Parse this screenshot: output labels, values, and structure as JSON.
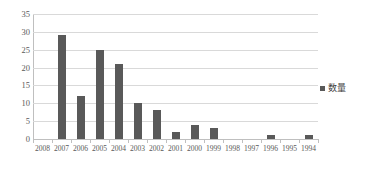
{
  "chart_data": {
    "type": "bar",
    "title": "",
    "xlabel": "",
    "ylabel": "",
    "categories": [
      "2008",
      "2007",
      "2006",
      "2005",
      "2004",
      "2003",
      "2002",
      "2001",
      "2000",
      "1999",
      "1998",
      "1997",
      "1996",
      "1995",
      "1994"
    ],
    "values": [
      0,
      29,
      12,
      25,
      21,
      10,
      8,
      2,
      4,
      3,
      0,
      0,
      1,
      0,
      1
    ],
    "series": [
      {
        "name": "数量",
        "values": [
          0,
          29,
          12,
          25,
          21,
          10,
          8,
          2,
          4,
          3,
          0,
          0,
          1,
          0,
          1
        ]
      }
    ],
    "ylim": [
      0,
      35
    ],
    "y_ticks": [
      "0",
      "5",
      "10",
      "15",
      "20",
      "25",
      "30",
      "35"
    ],
    "y_tick_values": [
      0,
      5,
      10,
      15,
      20,
      25,
      30,
      35
    ],
    "grid": true,
    "legend_position": "right",
    "bar_color": "#595959",
    "gridline_color": "#d9d9d9",
    "axis_color": "#bfbfbf",
    "background_color": "#ffffff"
  },
  "legend": {
    "label": "数量",
    "swatch_name": "series-color-swatch"
  }
}
